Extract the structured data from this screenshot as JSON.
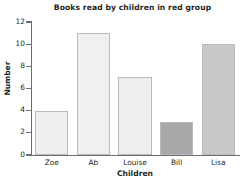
{
  "chart_data": {
    "type": "bar",
    "title": "Books read by children in red group",
    "xlabel": "Children",
    "ylabel": "Number",
    "categories": [
      "Zoe",
      "Ab",
      "Louise",
      "Bill",
      "Lisa"
    ],
    "values": [
      4,
      11,
      7,
      3,
      10
    ],
    "bar_colors": [
      "#efefef",
      "#f0f0f0",
      "#eeeeee",
      "#a8a8a8",
      "#c9c9c9"
    ],
    "bar_border_color": "#b9babc",
    "ylim": [
      0,
      12
    ],
    "yticks": [
      0,
      2,
      4,
      6,
      8,
      10,
      12
    ],
    "ytick_labels": [
      "0",
      "2",
      "4",
      "6",
      "8",
      "10",
      "12"
    ],
    "grid": false,
    "legend": null,
    "axis_color": "#6d6e71"
  }
}
